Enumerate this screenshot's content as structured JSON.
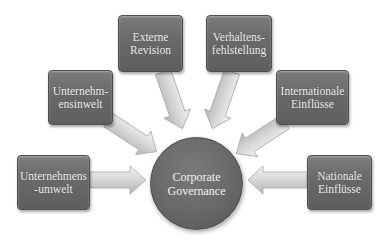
{
  "diagram": {
    "type": "hub-and-spoke",
    "center": {
      "label": "Corporate\nGovernance"
    },
    "nodes": [
      {
        "id": "unternehmensumwelt",
        "label": "Unternehmens\n-umwelt"
      },
      {
        "id": "unternehmensinwelt",
        "label": "Unternehm-\nensinwelt"
      },
      {
        "id": "externe-revision",
        "label": "Externe\nRevision"
      },
      {
        "id": "verhaltensfehlstellung",
        "label": "Verhaltens-\nfehlstellung"
      },
      {
        "id": "internationale-einfluesse",
        "label": "Internationale\nEinflüsse"
      },
      {
        "id": "nationale-einfluesse",
        "label": "Nationale\nEinflüsse"
      }
    ],
    "edges": [
      {
        "from": "unternehmensumwelt",
        "to": "center"
      },
      {
        "from": "unternehmensinwelt",
        "to": "center"
      },
      {
        "from": "externe-revision",
        "to": "center"
      },
      {
        "from": "verhaltensfehlstellung",
        "to": "center"
      },
      {
        "from": "internationale-einfluesse",
        "to": "center"
      },
      {
        "from": "nationale-einfluesse",
        "to": "center"
      }
    ],
    "colors": {
      "node_fill": "#6a6a6a",
      "node_text": "#f2f2f2",
      "arrow_fill": "#d4d4d4",
      "background": "#ffffff"
    }
  }
}
